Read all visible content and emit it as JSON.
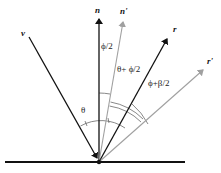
{
  "diagram": {
    "type": "reflection-vector-diagram",
    "colors": {
      "primary": "#111111",
      "secondary": "#a0a0a0",
      "background": "#ffffff"
    },
    "vectors": {
      "v": {
        "label": "v",
        "color": "#111111"
      },
      "n": {
        "label": "n",
        "color": "#111111"
      },
      "n_prime": {
        "label": "n'",
        "color": "#a0a0a0"
      },
      "r": {
        "label": "r",
        "color": "#111111"
      },
      "r_prime": {
        "label": "r'",
        "color": "#a0a0a0"
      }
    },
    "angles": {
      "theta": "θ",
      "phi_half": "ϕ/2",
      "theta_plus_phi_half": "θ+ ϕ/2",
      "phi_plus_beta_half": "ϕ+β/2"
    },
    "surface": {
      "label": ""
    }
  }
}
